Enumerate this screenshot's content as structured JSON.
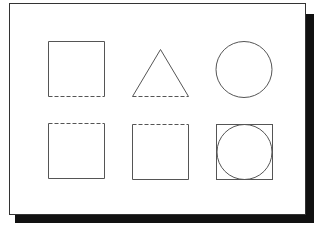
{
  "figure": {
    "colors": {
      "stroke": "#555555",
      "panel_border": "#333333",
      "shadow": "#111111",
      "background": "#ffffff"
    },
    "shapes": [
      {
        "id": "top-left-square",
        "type": "square",
        "dashed_edge": "bottom"
      },
      {
        "id": "top-middle-triangle",
        "type": "triangle",
        "dashed_edge": "bottom"
      },
      {
        "id": "top-right-circle",
        "type": "circle",
        "dashed_edge": "none"
      },
      {
        "id": "bottom-left-square",
        "type": "square",
        "dashed_edge": "top"
      },
      {
        "id": "bottom-middle-square",
        "type": "square",
        "dashed_edge": "top"
      },
      {
        "id": "bottom-right-square-with-circle",
        "type": "square-inscribed-circle",
        "dashed_edge": "none"
      }
    ]
  }
}
